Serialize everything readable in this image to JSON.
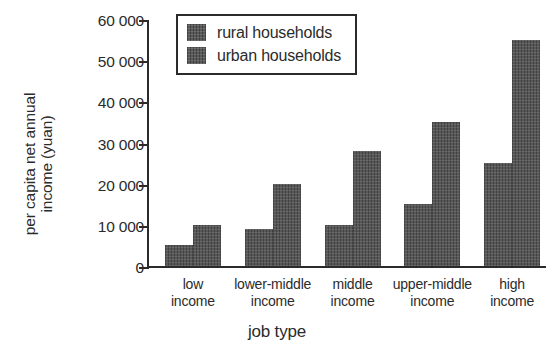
{
  "chart_data": {
    "type": "bar",
    "title": "",
    "xlabel": "job type",
    "ylabel_lines": [
      "per capita net annual",
      "income (yuan)"
    ],
    "ylabel": "per capita net annual income (yuan)",
    "categories": [
      "low income",
      "lower-middle income",
      "middle income",
      "upper-middle income",
      "high income"
    ],
    "category_lines": [
      [
        "low",
        "income"
      ],
      [
        "lower-middle",
        "income"
      ],
      [
        "middle",
        "income"
      ],
      [
        "upper-middle",
        "income"
      ],
      [
        "high",
        "income"
      ]
    ],
    "series": [
      {
        "name": "rural households",
        "values": [
          5000,
          9000,
          10000,
          15000,
          25000
        ],
        "color": "#4d4d4d"
      },
      {
        "name": "urban households",
        "values": [
          10000,
          20000,
          28000,
          35000,
          55000
        ],
        "color": "#4d4d4d"
      }
    ],
    "ylim": [
      0,
      60000
    ],
    "yticks": [
      0,
      10000,
      20000,
      30000,
      40000,
      50000,
      60000
    ],
    "ytick_labels": [
      "0",
      "10 000",
      "20 000",
      "30 000",
      "40 000",
      "50 000",
      "60 000"
    ],
    "grid": false,
    "legend_position": "top-left-inside"
  },
  "legend": {
    "entries": [
      {
        "label": "rural households",
        "swatch_name": "legend-swatch-rural"
      },
      {
        "label": "urban households",
        "swatch_name": "legend-swatch-urban"
      }
    ]
  },
  "colors": {
    "bar": "#4d4d4d",
    "axis": "#2b2b2b",
    "text": "#2b2b2b",
    "background": "#ffffff"
  }
}
